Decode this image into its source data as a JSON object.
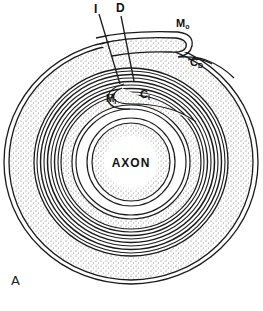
{
  "figure": {
    "panel_label": "A",
    "labels": {
      "axon": "AXON",
      "line_i": "I",
      "line_d": "D",
      "m0": "M",
      "m0_sub": "o",
      "cd": "C",
      "cd_sub": "D",
      "m1": "M",
      "m1_sub": "I",
      "c1": "C",
      "c1_sub": "I"
    },
    "colors": {
      "line": "#1a1a1a",
      "stipple": "#6b6b6b",
      "background": "#ffffff"
    }
  }
}
